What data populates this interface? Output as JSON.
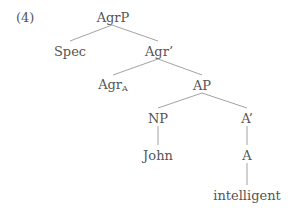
{
  "example_number": "(4)",
  "tree": {
    "nodes": {
      "agrp": {
        "label": "AgrP"
      },
      "spec": {
        "label": "Spec"
      },
      "agr_bar": {
        "label": "Agr’"
      },
      "agr_a": {
        "label": "Agr",
        "subscript": "A"
      },
      "ap": {
        "label": "AP"
      },
      "np": {
        "label": "NP"
      },
      "a_bar": {
        "label": "A’"
      },
      "john": {
        "label": "John"
      },
      "a": {
        "label": "A"
      },
      "intelligent": {
        "label": "intelligent"
      }
    },
    "edges": [
      [
        "AgrP",
        "Spec"
      ],
      [
        "AgrP",
        "Agr’"
      ],
      [
        "Agr’",
        "AgrA"
      ],
      [
        "Agr’",
        "AP"
      ],
      [
        "AP",
        "NP"
      ],
      [
        "AP",
        "A’"
      ],
      [
        "NP",
        "John"
      ],
      [
        "A’",
        "A"
      ],
      [
        "A",
        "intelligent"
      ]
    ]
  },
  "colors": {
    "text": "#555555",
    "line": "#8a8a8a"
  }
}
